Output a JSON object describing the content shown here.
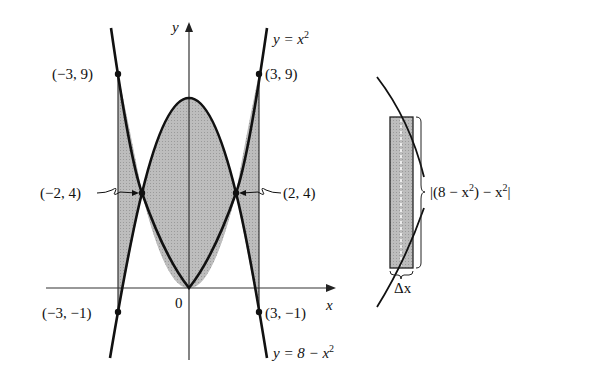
{
  "figure": {
    "left_panel": {
      "axis_labels": {
        "x": "x",
        "y": "y",
        "origin": "0"
      },
      "curves": [
        {
          "name": "upper-parabola",
          "label": "y = x²",
          "label_parts": [
            "y = x",
            "2"
          ]
        },
        {
          "name": "lower-parabola",
          "label": "y = 8 − x²",
          "label_parts": [
            "y = 8 − x",
            "2"
          ]
        }
      ],
      "points": [
        {
          "label": "(−3, 9)",
          "x": -3,
          "y": 9
        },
        {
          "label": "(3, 9)",
          "x": 3,
          "y": 9
        },
        {
          "label": "(−2, 4)",
          "x": -2,
          "y": 4
        },
        {
          "label": "(2, 4)",
          "x": 2,
          "y": 4
        },
        {
          "label": "(−3, −1)",
          "x": -3,
          "y": -1
        },
        {
          "label": "(3, −1)",
          "x": 3,
          "y": -1
        }
      ],
      "shaded_region": "between y = x² and y = 8 − x² for −3 ≤ x ≤ 3",
      "fill_color": "#b8b8b8",
      "line_color": "#111111"
    },
    "right_panel": {
      "height_label": "|(8 − x²) − x²|",
      "height_label_parts": [
        "|(8 − x",
        "2",
        ") − x",
        "2",
        "|"
      ],
      "width_label": "Δx",
      "rectangle_fill": "#b0b0b0"
    }
  }
}
